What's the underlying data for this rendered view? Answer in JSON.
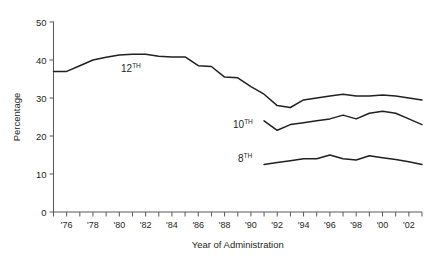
{
  "chart_data": {
    "type": "line",
    "title": "",
    "xlabel": "Year of Administration",
    "ylabel": "Percentage",
    "ylim": [
      0,
      50
    ],
    "xlim": [
      1975,
      2003
    ],
    "yticks": [
      0,
      10,
      20,
      30,
      40,
      50
    ],
    "ytick_labels": [
      "0",
      "10",
      "20",
      "30",
      "40",
      "50"
    ],
    "xticks": [
      1975,
      1976,
      1977,
      1978,
      1979,
      1980,
      1981,
      1982,
      1983,
      1984,
      1985,
      1986,
      1987,
      1988,
      1989,
      1990,
      1991,
      1992,
      1993,
      1994,
      1995,
      1996,
      1997,
      1998,
      1999,
      2000,
      2001,
      2002,
      2003
    ],
    "xtick_labels": [
      "'76",
      "'78",
      "'80",
      "'82",
      "'84",
      "'86",
      "'88",
      "'90",
      "'92",
      "'94",
      "'96",
      "'98",
      "'00",
      "'02"
    ],
    "xtick_label_years": [
      1976,
      1978,
      1980,
      1982,
      1984,
      1986,
      1988,
      1990,
      1992,
      1994,
      1996,
      1998,
      2000,
      2002
    ],
    "grid": false,
    "legend_position": "inline-annotations",
    "series": [
      {
        "name": "12TH",
        "label": "12",
        "label_sup": "TH",
        "color": "#231f20",
        "x": [
          1975,
          1976,
          1977,
          1978,
          1979,
          1980,
          1981,
          1982,
          1983,
          1984,
          1985,
          1986,
          1987,
          1988,
          1989,
          1990,
          1991,
          1992,
          1993,
          1994,
          1995,
          1996,
          1997,
          1998,
          1999,
          2000,
          2001,
          2002,
          2003
        ],
        "values": [
          37.0,
          37.0,
          38.5,
          40.0,
          40.7,
          41.3,
          41.5,
          41.5,
          41.0,
          40.8,
          40.8,
          38.5,
          38.3,
          35.5,
          35.3,
          33.0,
          31.0,
          28.0,
          27.5,
          29.5,
          30.0,
          30.5,
          31.0,
          30.5,
          30.5,
          30.8,
          30.5,
          30.0,
          29.5
        ]
      },
      {
        "name": "10TH",
        "label": "10",
        "label_sup": "TH",
        "color": "#231f20",
        "x": [
          1991,
          1992,
          1993,
          1994,
          1995,
          1996,
          1997,
          1998,
          1999,
          2000,
          2001,
          2002,
          2003
        ],
        "values": [
          24.0,
          21.5,
          23.0,
          23.5,
          24.0,
          24.5,
          25.5,
          24.5,
          26.0,
          26.5,
          26.0,
          24.5,
          23.0
        ]
      },
      {
        "name": "8TH",
        "label": "8",
        "label_sup": "TH",
        "color": "#231f20",
        "x": [
          1991,
          1992,
          1993,
          1994,
          1995,
          1996,
          1997,
          1998,
          1999,
          2000,
          2001,
          2002,
          2003
        ],
        "values": [
          12.5,
          13.0,
          13.5,
          14.0,
          14.0,
          15.0,
          14.0,
          13.7,
          14.8,
          14.3,
          13.8,
          13.2,
          12.5
        ]
      }
    ],
    "annotations": [
      {
        "text": "12TH",
        "series": "12TH",
        "x_px": 121,
        "y_px": 72
      },
      {
        "text": "10TH",
        "series": "10TH",
        "x_px": 233,
        "y_px": 128
      },
      {
        "text": "8TH",
        "series": "8TH",
        "x_px": 238,
        "y_px": 162
      }
    ]
  },
  "axes": {
    "y_title": "Percentage",
    "x_title": "Year of Administration"
  }
}
